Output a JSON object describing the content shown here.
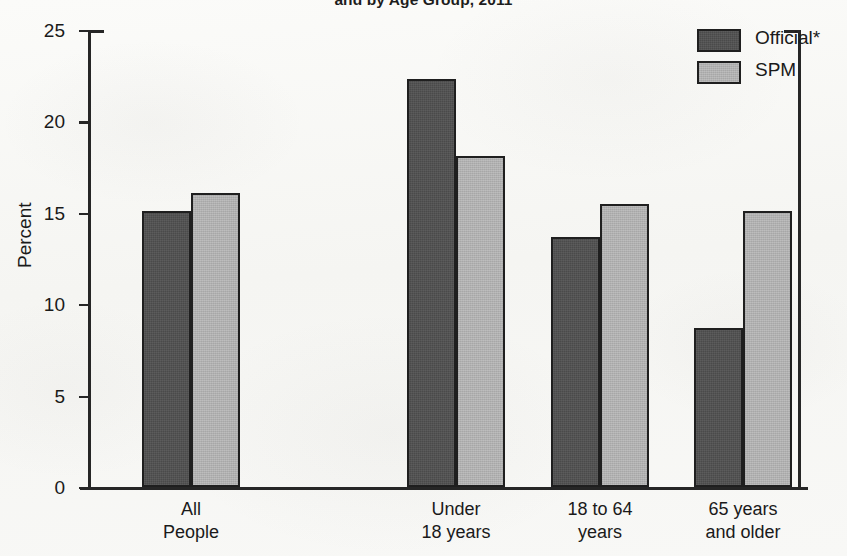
{
  "chart_data": {
    "type": "bar",
    "title": "and by Age Group, 2011",
    "xlabel": "",
    "ylabel": "Percent",
    "ylim": [
      0,
      25
    ],
    "yticks": [
      0,
      5,
      10,
      15,
      20,
      25
    ],
    "grid": false,
    "legend_position": "top-right",
    "categories": [
      "All\nPeople",
      "Under\n18 years",
      "18 to 64\nyears",
      "65 years\nand older"
    ],
    "category_lines": [
      [
        "All",
        "People"
      ],
      [
        "Under",
        "18 years"
      ],
      [
        "18 to 64",
        "years"
      ],
      [
        "65 years",
        "and older"
      ]
    ],
    "series": [
      {
        "name": "Official*",
        "color": "#4a4a4a",
        "values": [
          15.1,
          22.3,
          13.7,
          8.7
        ]
      },
      {
        "name": "SPM",
        "color": "#b0b0b0",
        "values": [
          16.1,
          18.1,
          15.5,
          15.1
        ]
      }
    ]
  },
  "axis": {
    "y_title": "Percent",
    "y_tick_labels": [
      "0",
      "5",
      "10",
      "15",
      "20",
      "25"
    ]
  },
  "legend": {
    "items": [
      {
        "label": "Official*",
        "style": "official"
      },
      {
        "label": "SPM",
        "style": "spm"
      }
    ]
  },
  "colors": {
    "official": "#4a4a4a",
    "spm": "#b0b0b0",
    "ink": "#1f1f1f",
    "paper": "#f7f7f5"
  }
}
